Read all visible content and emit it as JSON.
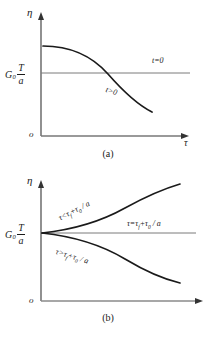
{
  "figure_a": {
    "caption": "(a)",
    "axis_y_label": "η",
    "axis_x_label": "τ",
    "origin_label": "o",
    "value_label": {
      "base": "G",
      "subscript": "0",
      "numerator": "T",
      "denominator": "a"
    },
    "curve_labels": {
      "horizontal_line": "t=0",
      "falling_curve": "t>0"
    }
  },
  "figure_b": {
    "caption": "(b)",
    "axis_y_label": "η",
    "axis_x_label": "",
    "origin_label": "o",
    "value_label": {
      "base": "G",
      "subscript": "0",
      "numerator": "T",
      "denominator": "a"
    },
    "curve_labels": {
      "upper_curve": "τ<τ f+τ 0 / a",
      "middle_line": "τ=τ f+τ 0 / a",
      "lower_curve": "τ>τ f+τ 0 / a"
    }
  },
  "chart_data": {
    "type": "line",
    "title": "",
    "panels": [
      {
        "id": "a",
        "caption": "(a)",
        "xlabel": "τ",
        "ylabel": "η",
        "origin": "o",
        "reference_level_label": "G0 T/a",
        "xlim": [
          0,
          10
        ],
        "ylim": [
          0,
          10
        ],
        "grid": false,
        "legend": "inline-annotations",
        "series": [
          {
            "name": "t=0",
            "style": "thin-horizontal-line",
            "x": [
              0,
              10
            ],
            "y": [
              5.0,
              5.0
            ],
            "annotation": "t=0",
            "annotation_x": 8.2,
            "annotation_y": 5.9
          },
          {
            "name": "t>0",
            "style": "thick-curve",
            "x": [
              0.15,
              1.5,
              3.0,
              4.5,
              5.6,
              6.6,
              7.5,
              8.3
            ],
            "y": [
              7.0,
              6.9,
              6.5,
              5.8,
              5.2,
              4.4,
              3.5,
              2.6
            ],
            "annotation": "t>0",
            "annotation_x": 5.3,
            "annotation_y": 3.7
          }
        ]
      },
      {
        "id": "b",
        "caption": "(b)",
        "xlabel": "",
        "ylabel": "η",
        "origin": "o",
        "reference_level_label": "G0 T/a",
        "xlim": [
          0,
          10
        ],
        "ylim": [
          0,
          10
        ],
        "grid": false,
        "legend": "inline-annotations",
        "series": [
          {
            "name": "tau < tau_f + tau_0/a",
            "style": "thick-curve-rising",
            "x": [
              0.2,
              1.5,
              3.0,
              4.5,
              6.0,
              7.3,
              8.3
            ],
            "y": [
              5.0,
              5.3,
              5.9,
              6.7,
              7.7,
              8.8,
              9.6
            ],
            "annotation": "τ<τf+τ0 / a",
            "annotation_x": 3.2,
            "annotation_y": 7.6
          },
          {
            "name": "tau = tau_f + tau_0/a",
            "style": "thin-horizontal-line",
            "x": [
              0.2,
              10
            ],
            "y": [
              5.0,
              5.0
            ],
            "annotation": "τ=τf+τ0 / a",
            "annotation_x": 6.3,
            "annotation_y": 5.6
          },
          {
            "name": "tau > tau_f + tau_0/a",
            "style": "thick-curve-falling",
            "x": [
              0.2,
              1.5,
              3.0,
              4.5,
              6.0,
              7.3,
              8.3
            ],
            "y": [
              5.0,
              4.7,
              4.2,
              3.5,
              2.6,
              1.6,
              0.9
            ],
            "annotation": "τ>τf+τ0 / a",
            "annotation_x": 2.6,
            "annotation_y": 2.9
          }
        ]
      }
    ]
  }
}
